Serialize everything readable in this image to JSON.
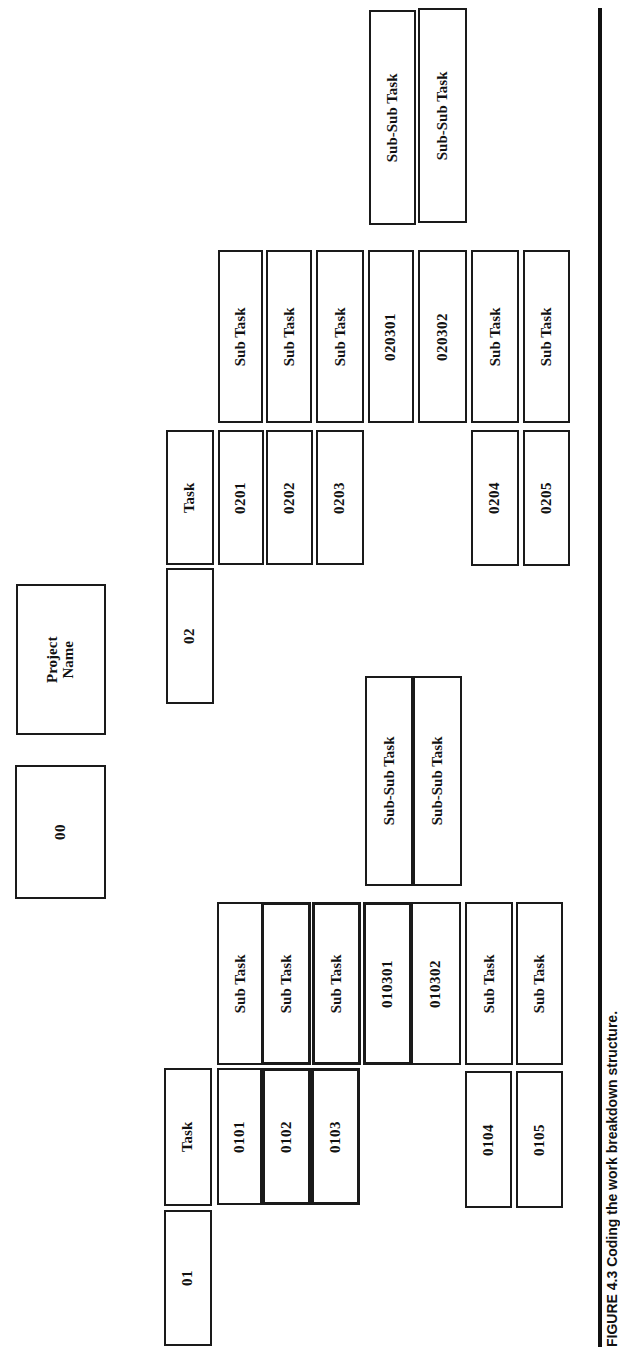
{
  "diagram": {
    "type": "work-breakdown-structure",
    "orientation": "rotated-90-ccw",
    "root": {
      "code": "00",
      "label": "Project Name"
    },
    "branches": [
      {
        "code": "01",
        "label": "Task",
        "children": [
          {
            "code": "0101",
            "label": "Sub Task"
          },
          {
            "code": "0102",
            "label": "Sub Task"
          },
          {
            "code": "0103",
            "label": "Sub Task",
            "children": [
              {
                "code": "010301",
                "label": "Sub-Sub Task"
              },
              {
                "code": "010302",
                "label": "Sub-Sub Task"
              }
            ]
          },
          {
            "code": "0104",
            "label": "Sub Task"
          },
          {
            "code": "0105",
            "label": "Sub Task"
          }
        ]
      },
      {
        "code": "02",
        "label": "Task",
        "children": [
          {
            "code": "0201",
            "label": "Sub Task"
          },
          {
            "code": "0202",
            "label": "Sub Task"
          },
          {
            "code": "0203",
            "label": "Sub Task",
            "children": [
              {
                "code": "020301",
                "label": "Sub-Sub Task"
              },
              {
                "code": "020302",
                "label": "Sub-Sub Task"
              }
            ]
          },
          {
            "code": "0204",
            "label": "Sub Task"
          },
          {
            "code": "0205",
            "label": "Sub Task"
          }
        ]
      }
    ]
  },
  "caption": "FIGURE 4.3  Coding the work breakdown structure."
}
